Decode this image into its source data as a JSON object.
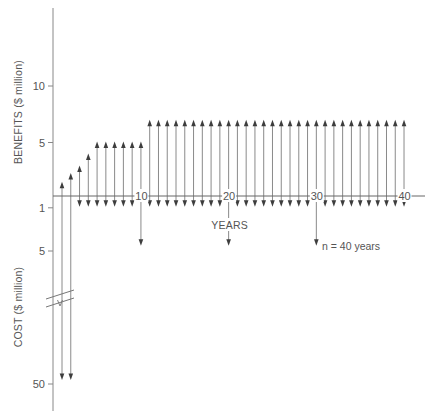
{
  "chart_data": {
    "type": "cash-flow-diagram",
    "title": "",
    "xlabel": "YEARS",
    "ylabel_top": "BENEFITS ($ million)",
    "ylabel_bottom": "COST ($ million)",
    "annotation": "n = 40 years",
    "grid": false,
    "legend": null,
    "x_ticks": [
      {
        "label": "10",
        "year": 10
      },
      {
        "label": "20",
        "year": 20
      },
      {
        "label": "30",
        "year": 30
      },
      {
        "label": "40",
        "year": 40
      }
    ],
    "benefit_ticks": [
      {
        "label": "10",
        "value": 10
      },
      {
        "label": "5",
        "value": 5
      }
    ],
    "cost_ticks": [
      {
        "label": "1",
        "value": 1
      },
      {
        "label": "5",
        "value": 5
      },
      {
        "label": "50",
        "value": 50
      }
    ],
    "axis_break": "cost axis broken between 5 and 50",
    "x": [
      1,
      2,
      3,
      4,
      5,
      6,
      7,
      8,
      9,
      10,
      11,
      12,
      13,
      14,
      15,
      16,
      17,
      18,
      19,
      20,
      21,
      22,
      23,
      24,
      25,
      26,
      27,
      28,
      29,
      30,
      31,
      32,
      33,
      34,
      35,
      36,
      37,
      38,
      39,
      40
    ],
    "series": [
      {
        "name": "Benefits ($ million, upward arrows)",
        "values": [
          1.3,
          2.1,
          2.8,
          3.9,
          5,
          5,
          5,
          5,
          5,
          5,
          7,
          7,
          7,
          7,
          7,
          7,
          7,
          7,
          7,
          7,
          7,
          7,
          7,
          7,
          7,
          7,
          7,
          7,
          7,
          7,
          7,
          7,
          7,
          7,
          7,
          7,
          7,
          7,
          7,
          7
        ]
      },
      {
        "name": "Costs ($ million, downward arrows)",
        "values": [
          50,
          50,
          1,
          1,
          1,
          1,
          1,
          1,
          1,
          4.6,
          1,
          1,
          1,
          1,
          1,
          1,
          1,
          1,
          1,
          4.6,
          1,
          1,
          1,
          1,
          1,
          1,
          1,
          1,
          1,
          4.6,
          1,
          1,
          1,
          1,
          1,
          1,
          1,
          1,
          1,
          1
        ]
      }
    ]
  }
}
